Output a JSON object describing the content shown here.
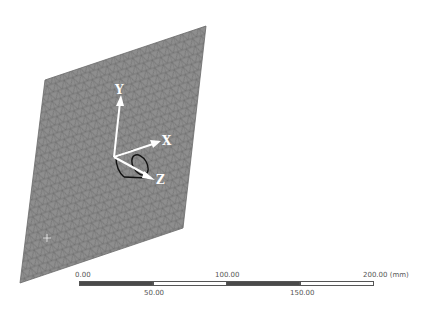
{
  "viewport": {
    "background": "#ffffff",
    "mesh_color": "#8c8c8c",
    "mesh_line_color": "#5a5a5a"
  },
  "triad": {
    "x_label": "X",
    "y_label": "Y",
    "z_label": "Z"
  },
  "scale_bar": {
    "ticks_top": [
      "0.00",
      "100.00",
      "200.00 (mm)"
    ],
    "ticks_bottom": [
      "50.00",
      "150.00"
    ]
  }
}
